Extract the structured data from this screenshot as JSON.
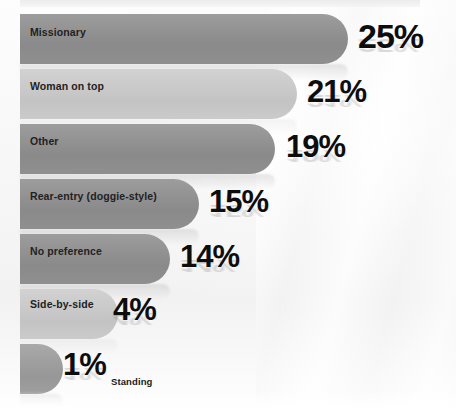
{
  "chart_data": {
    "type": "bar",
    "orientation": "horizontal",
    "title": "",
    "subtitle": "",
    "xlabel": "",
    "ylabel": "",
    "grid": false,
    "legend": false,
    "value_suffix": "%",
    "xlim": [
      0,
      25
    ],
    "categories": [
      "Missionary",
      "Woman on top",
      "Other",
      "Rear-entry (doggie-style)",
      "No preference",
      "Side-by-side",
      "Standing"
    ],
    "values": [
      25,
      21,
      19,
      15,
      14,
      4,
      1
    ],
    "value_labels": [
      "25%",
      "21%",
      "19%",
      "15%",
      "14%",
      "4%",
      "1%"
    ],
    "bar_colors": [
      "#919191",
      "#c9c9c9",
      "#919191",
      "#919191",
      "#919191",
      "#c9c9c9",
      "#9e9e9e"
    ],
    "label_placement": [
      "inside",
      "inside",
      "inside",
      "inside",
      "inside",
      "inside",
      "outside"
    ],
    "background_color": "#f7f7f7",
    "value_text_color": "#0d0d0d",
    "category_text_color": "#222222"
  },
  "bars": [
    {
      "label": "Missionary",
      "value_label": "25%",
      "tone": "dark",
      "top": 14,
      "bar_width": 328,
      "label_top": 27,
      "value_left": 358,
      "value_top": 19,
      "value_size": 34,
      "label_inside": true
    },
    {
      "label": "Woman on top",
      "value_label": "21%",
      "tone": "light",
      "top": 69,
      "bar_width": 277,
      "label_top": 81,
      "value_left": 307,
      "value_top": 76,
      "value_size": 31,
      "label_inside": true
    },
    {
      "label": "Other",
      "value_label": "19%",
      "tone": "dark",
      "top": 124,
      "bar_width": 255,
      "label_top": 136,
      "value_left": 286,
      "value_top": 131,
      "value_size": 31,
      "label_inside": true
    },
    {
      "label": "Rear-entry (doggie-style)",
      "value_label": "15%",
      "tone": "dark",
      "top": 179,
      "bar_width": 179,
      "label_top": 191,
      "value_left": 209,
      "value_top": 186,
      "value_size": 31,
      "label_inside": true
    },
    {
      "label": "No preference",
      "value_label": "14%",
      "tone": "dark",
      "top": 234,
      "bar_width": 150,
      "label_top": 246,
      "value_left": 180,
      "value_top": 241,
      "value_size": 31,
      "label_inside": true
    },
    {
      "label": "Side-by-side",
      "value_label": "4%",
      "tone": "light",
      "top": 289,
      "bar_width": 98,
      "label_top": 299,
      "value_left": 113,
      "value_top": 294,
      "value_size": 31,
      "label_inside": true
    },
    {
      "label": "Standing",
      "value_label": "1%",
      "tone": "mid",
      "top": 344,
      "bar_width": 43,
      "label_top": 377,
      "value_left": 63,
      "value_top": 349,
      "value_size": 31,
      "label_inside": false
    }
  ]
}
